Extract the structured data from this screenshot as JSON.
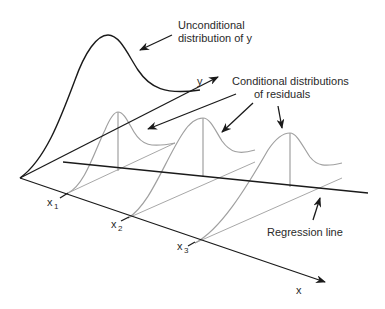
{
  "diagram": {
    "labels": {
      "unconditional_line1": "Unconditional",
      "unconditional_line2": "distribution of y",
      "conditional_line1": "Conditional distributions",
      "conditional_line2": "of residuals",
      "regression_line": "Regression line",
      "y_axis": "y",
      "x_axis": "x"
    },
    "x_ticks": [
      {
        "base": "x",
        "sub": "1"
      },
      {
        "base": "x",
        "sub": "2"
      },
      {
        "base": "x",
        "sub": "3"
      }
    ],
    "colors": {
      "axis": "#1a1a1a",
      "conditional_curves": "#a0a0a0",
      "text": "#2a2a2a"
    }
  }
}
